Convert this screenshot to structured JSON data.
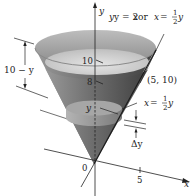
{
  "figure": {
    "type": "cone-volume-slicing-diagram",
    "equation_label": {
      "lhs": "y = 2",
      "x1": "x",
      "mid": " or ",
      "x2": "x",
      "eq": " = ",
      "frac_num": "1",
      "frac_den": "2",
      "y": "y"
    },
    "point_label": "(5, 10)",
    "slice_label": {
      "x": "x",
      "eq": " = ",
      "frac_num": "1",
      "frac_den": "2",
      "y": "y"
    },
    "height_label": "10 − y",
    "delta_label": "Δy",
    "axis_labels": {
      "y_axis": "y",
      "x_axis": "x",
      "origin": "0",
      "slice_y": "y"
    },
    "ticks": {
      "y_10": "10",
      "y_8": "8",
      "x_5": "5"
    },
    "colors": {
      "cone_dark": "#5a5a5a",
      "cone_mid": "#8c8c8c",
      "cone_light": "#c8c8c8",
      "rim": "#b0b0b0",
      "water_surface": "#d9d9d9",
      "line": "#222222"
    }
  }
}
